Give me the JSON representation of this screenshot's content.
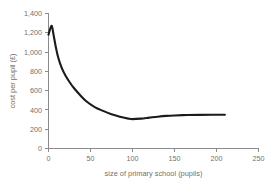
{
  "chart_data": {
    "type": "line",
    "title": "",
    "xlabel": "size of primary school (pupils)",
    "ylabel": "cost per pupil (£)",
    "xlim": [
      0,
      250
    ],
    "ylim": [
      0,
      1400
    ],
    "xticks": [
      "0",
      "50",
      "100",
      "150",
      "200",
      "250"
    ],
    "xtick_values": [
      0,
      50,
      100,
      150,
      200,
      250
    ],
    "yticks": [
      "0",
      "200",
      "400",
      "600",
      "800",
      "1,000",
      "1,200",
      "1,400"
    ],
    "ytick_values": [
      0,
      200,
      400,
      600,
      800,
      1000,
      1200,
      1400
    ],
    "grid": false,
    "legend": null,
    "series": [
      {
        "name": "cost per pupil",
        "color": "#1b1b1b",
        "x": [
          0,
          2,
          4,
          6,
          9,
          12,
          16,
          20,
          25,
          30,
          37,
          45,
          55,
          65,
          75,
          85,
          95,
          100,
          110,
          120,
          130,
          140,
          150,
          165,
          180,
          195,
          210
        ],
        "y": [
          1180,
          1240,
          1270,
          1180,
          1040,
          930,
          830,
          760,
          690,
          630,
          560,
          490,
          430,
          390,
          355,
          330,
          310,
          305,
          310,
          320,
          330,
          338,
          343,
          347,
          349,
          350,
          350
        ]
      }
    ]
  },
  "axes": {
    "x_axis_name": "x-axis",
    "y_axis_name": "y-axis"
  }
}
